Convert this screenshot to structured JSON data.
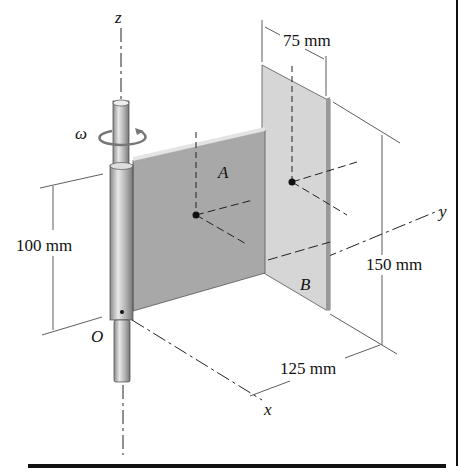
{
  "figure": {
    "axes": {
      "z": "z",
      "y": "y",
      "x": "x",
      "origin": "O"
    },
    "rotation_symbol": "ω",
    "plates": {
      "a": "A",
      "b": "B"
    },
    "dimensions": {
      "width_b": "75 mm",
      "height_a": "100 mm",
      "height_b": "150 mm",
      "offset_b": "125 mm"
    },
    "colors": {
      "plate_a": "#a9a9a9",
      "plate_b": "#d4d4d4",
      "shaft": "#b8b8b8",
      "line": "#222222"
    }
  }
}
